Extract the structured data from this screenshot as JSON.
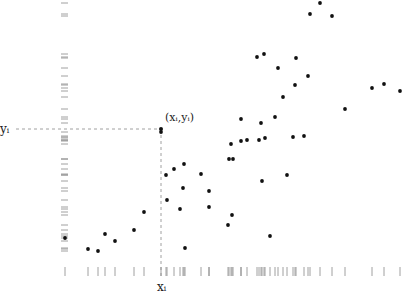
{
  "chart_data": {
    "type": "scatter",
    "title": "",
    "xlabel": "x_i",
    "ylabel": "y_i",
    "grid": false,
    "legend": null,
    "axes_visible": false,
    "rug_plots": {
      "x": true,
      "y": true
    },
    "highlight": {
      "label": "(x_i, y_i)",
      "x": 161,
      "y": 129,
      "guide_lines": "dashed to both axes"
    },
    "labels": {
      "point": "(xᵢ,yᵢ)",
      "x_axis": "xᵢ",
      "y_axis": "yᵢ"
    },
    "pixel_frame": {
      "x_range_px": [
        60,
        405
      ],
      "y_range_px": [
        0,
        250
      ],
      "note": "values are pixel positions; no numeric ticks shown"
    },
    "points": [
      [
        65,
        235
      ],
      [
        88,
        246
      ],
      [
        98,
        248
      ],
      [
        105,
        231
      ],
      [
        115,
        238
      ],
      [
        134,
        227
      ],
      [
        144,
        209
      ],
      [
        161,
        129
      ],
      [
        166,
        172
      ],
      [
        167,
        197
      ],
      [
        174,
        166
      ],
      [
        180,
        206
      ],
      [
        184,
        161
      ],
      [
        183,
        185
      ],
      [
        185,
        245
      ],
      [
        201,
        171
      ],
      [
        209,
        188
      ],
      [
        209,
        204
      ],
      [
        228,
        222
      ],
      [
        229,
        156
      ],
      [
        231,
        141
      ],
      [
        232,
        212
      ],
      [
        233,
        156
      ],
      [
        241,
        138
      ],
      [
        241,
        116
      ],
      [
        247,
        137
      ],
      [
        259,
        137
      ],
      [
        261,
        120
      ],
      [
        262,
        178
      ],
      [
        265,
        135
      ],
      [
        270,
        233
      ],
      [
        275,
        114
      ],
      [
        287,
        172
      ],
      [
        283,
        94
      ],
      [
        293,
        134
      ],
      [
        295,
        82
      ],
      [
        304,
        133
      ],
      [
        278,
        65
      ],
      [
        296,
        55
      ],
      [
        308,
        73
      ],
      [
        345,
        106
      ],
      [
        372,
        85
      ],
      [
        384,
        81
      ],
      [
        400,
        88
      ],
      [
        257,
        54
      ],
      [
        264,
        51
      ],
      [
        310,
        11
      ],
      [
        320,
        0
      ],
      [
        332,
        13
      ]
    ],
    "colors": {
      "points": "#111111",
      "rug": "#888888",
      "guides": "#888888",
      "background": "#ffffff"
    }
  }
}
